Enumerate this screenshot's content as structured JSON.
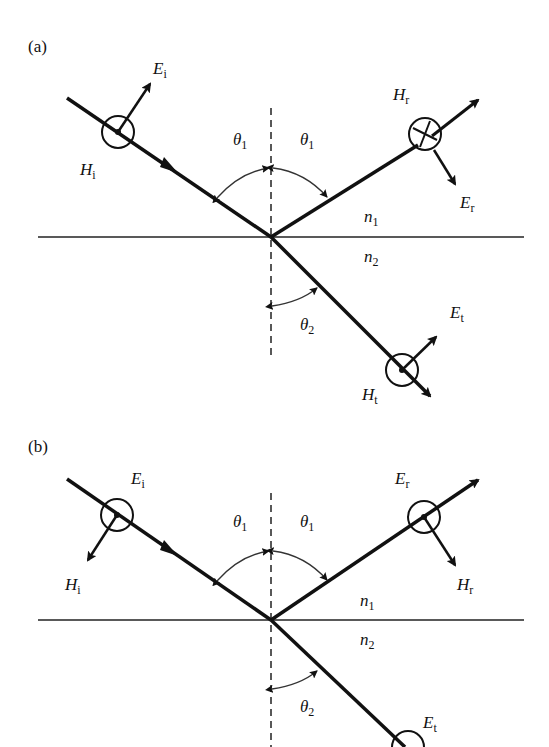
{
  "figure": {
    "panels": [
      {
        "id": "a",
        "label": "(a)",
        "polarization": "E in plane of incidence (H perpendicular)",
        "labels": {
          "E_i": {
            "base": "E",
            "sub": "i"
          },
          "H_i": {
            "base": "H",
            "sub": "i"
          },
          "E_r": {
            "base": "E",
            "sub": "r"
          },
          "H_r": {
            "base": "H",
            "sub": "r"
          },
          "E_t": {
            "base": "E",
            "sub": "t"
          },
          "H_t": {
            "base": "H",
            "sub": "t"
          },
          "theta1_left": {
            "base": "θ",
            "sub": "1"
          },
          "theta1_right": {
            "base": "θ",
            "sub": "1"
          },
          "theta2": {
            "base": "θ",
            "sub": "2"
          },
          "n1": {
            "base": "n",
            "sub": "1"
          },
          "n2": {
            "base": "n",
            "sub": "2"
          }
        },
        "symbols": {
          "incident": "dot",
          "reflected": "cross",
          "transmitted": "dot"
        }
      },
      {
        "id": "b",
        "label": "(b)",
        "polarization": "E perpendicular to plane of incidence",
        "labels": {
          "E_i": {
            "base": "E",
            "sub": "i"
          },
          "H_i": {
            "base": "H",
            "sub": "i"
          },
          "E_r": {
            "base": "E",
            "sub": "r"
          },
          "H_r": {
            "base": "H",
            "sub": "r"
          },
          "E_t": {
            "base": "E",
            "sub": "t"
          },
          "theta1_left": {
            "base": "θ",
            "sub": "1"
          },
          "theta1_right": {
            "base": "θ",
            "sub": "1"
          },
          "theta2": {
            "base": "θ",
            "sub": "2"
          },
          "n1": {
            "base": "n",
            "sub": "1"
          },
          "n2": {
            "base": "n",
            "sub": "2"
          }
        },
        "symbols": {
          "incident": "dot",
          "reflected": "dot",
          "transmitted": "dot"
        }
      }
    ]
  }
}
